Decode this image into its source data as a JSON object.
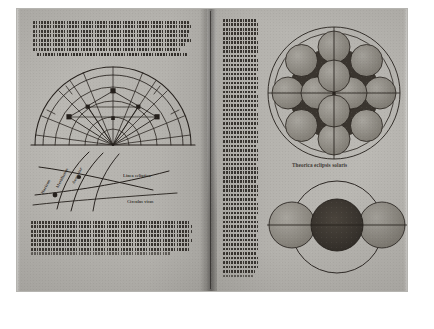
{
  "document": {
    "type": "printed-book-spread",
    "medium": "incunabulum / early printed astronomical treatise",
    "script": "gothic-blackletter",
    "background_color": "#ffffff",
    "paper_color": "#b9b7b2",
    "ink_color": "#241f1b"
  },
  "left_page": {
    "top_text": {
      "lines_count": 7,
      "note": "dense gothic paragraph, seven justified lines at head of page"
    },
    "heading": {
      "label": "Theorica diuersitatis aspectus & commutationis utilis",
      "style": "rubric-line"
    },
    "figure_upper": {
      "name": "semicircle-aspect-diagram",
      "description": "Semicircular graduated diagram with concentric arcs, radiating spokes from the centre of the base line, and small filled square markers at intersections",
      "arcs": 5,
      "spokes": 11,
      "markers": 6,
      "baseline": true
    },
    "figure_lower": {
      "name": "curved-arc-diagram",
      "description": "Family of curved arcs crossing at two nodes, each arc carrying a rotated gothic label",
      "arcs": 5,
      "nodes": 2,
      "labels": [
        "Horizon",
        "Meridianus",
        "Aequator",
        "Linea ecliptica",
        "Circulus visus"
      ]
    },
    "bottom_text": {
      "lines_count": 8,
      "note": "dense gothic paragraph closing the page"
    }
  },
  "right_page": {
    "text_column": {
      "lines_count": 58,
      "note": "narrow single column of gothic text running the full height of the page"
    },
    "figure_upper": {
      "name": "lunar-eclipse-diagram",
      "caption": "Theorica eclipsis solaris",
      "description": "Dark circular shadow of the earth ringed by twelve lighter lunar discs, enclosed by two concentric circles with a horizontal and vertical axis",
      "shadow_disc": {
        "fill": "#3a352f"
      },
      "moon_discs": 12,
      "outer_circles": 2,
      "axes": [
        "horizontal",
        "vertical"
      ]
    },
    "figure_lower": {
      "name": "solar-eclipse-diagram",
      "description": "Three discs in a horizontal row - two pale lateral discs and one dark central disc - enclosed by a large circle crossed by a horizontal axis",
      "discs": 3,
      "central_disc_fill": "#3a352f",
      "enclosing_circle": true
    }
  },
  "captions": {
    "eclipse_solar": "Theorica eclipsis solaris",
    "curve_label_1": "Horizon",
    "curve_label_2": "Meridianus",
    "curve_label_3": "Aequator",
    "curve_label_4": "Linea ecliptica",
    "curve_label_5": "Circulus visus"
  }
}
